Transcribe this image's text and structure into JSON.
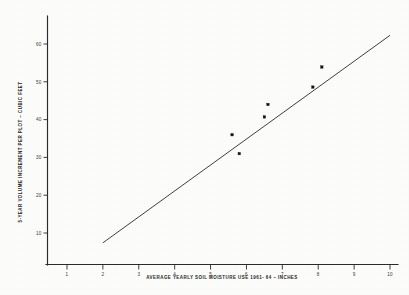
{
  "chart_data": {
    "type": "scatter",
    "title": "",
    "xlabel": "AVERAGE YEARLY SOIL MOISTURE USE 1961- 64 – INCHES",
    "ylabel": "5-YEAR VOLUME INCREMENT PER PLOT – CUBIC FEET",
    "xlim": [
      0.4,
      10.4
    ],
    "ylim": [
      5,
      64
    ],
    "grid": false,
    "legend": null,
    "xticks": [
      1,
      2,
      3,
      4,
      5,
      6,
      7,
      8,
      9,
      10
    ],
    "xtick_labels": [
      "1",
      "2",
      "3",
      "4",
      "5",
      "6",
      "7",
      "8",
      "9",
      "10"
    ],
    "yticks": [
      10,
      20,
      30,
      40,
      50,
      60
    ],
    "ytick_labels": [
      "10",
      "20",
      "30",
      "40",
      "50",
      "60"
    ],
    "series": [
      {
        "name": "plot observations",
        "marker": "filled-square",
        "color": "#141414",
        "points": [
          {
            "x": 5.6,
            "y": 36.0
          },
          {
            "x": 5.8,
            "y": 31.0
          },
          {
            "x": 6.5,
            "y": 40.7
          },
          {
            "x": 6.6,
            "y": 44.0
          },
          {
            "x": 7.85,
            "y": 48.6
          },
          {
            "x": 8.1,
            "y": 53.9
          }
        ]
      },
      {
        "name": "fitted regression line",
        "type": "line",
        "color": "#1d1d1d",
        "endpoints": [
          {
            "x": 2.0,
            "y": 7.4
          },
          {
            "x": 10.0,
            "y": 62.3
          }
        ]
      }
    ]
  },
  "axes": {
    "x_axis_name": "x-axis",
    "y_axis_name": "y-axis"
  }
}
